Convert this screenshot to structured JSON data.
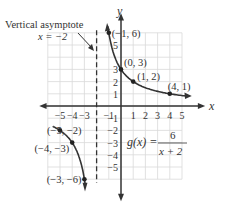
{
  "chart_data": {
    "type": "line",
    "title": "",
    "function_label": "g(x) = 6 / (x + 2)",
    "function_name": "g(x) =",
    "numerator": "6",
    "denominator": "x + 2",
    "xlabel": "x",
    "ylabel": "y",
    "xlim": [
      -6,
      6
    ],
    "ylim": [
      -6,
      6
    ],
    "grid": true,
    "x_ticks": [
      "−5",
      "−4",
      "−3",
      "−1",
      "1",
      "2",
      "3",
      "4",
      "5"
    ],
    "y_ticks": [
      "5",
      "3",
      "2",
      "1",
      "−1",
      "−2",
      "−3",
      "−4",
      "−5"
    ],
    "asymptote": {
      "label": "Vertical asymptote",
      "equation": "x = −2",
      "x": -2
    },
    "series": [
      {
        "name": "right branch",
        "x": [
          -1,
          0,
          1,
          4
        ],
        "y": [
          6,
          3,
          2,
          1
        ]
      },
      {
        "name": "left branch",
        "x": [
          -5,
          -4,
          -3
        ],
        "y": [
          -2,
          -3,
          -6
        ]
      }
    ],
    "point_labels": [
      {
        "text": "(−1, 6)",
        "x": -1,
        "y": 6
      },
      {
        "text": "(0, 3)",
        "x": 0,
        "y": 3
      },
      {
        "text": "(1, 2)",
        "x": 1,
        "y": 2
      },
      {
        "text": "(4, 1)",
        "x": 4,
        "y": 1
      },
      {
        "text": "(−5, −2)",
        "x": -5,
        "y": -2
      },
      {
        "text": "(−4, −3)",
        "x": -4,
        "y": -3
      },
      {
        "text": "(−3, −6)",
        "x": -3,
        "y": -6
      }
    ]
  }
}
